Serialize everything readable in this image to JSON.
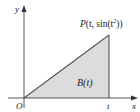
{
  "diagram": {
    "axes": {
      "x_label": "x",
      "y_label": "y",
      "origin_label": "O"
    },
    "point": {
      "label_prefix": "P",
      "label_args": "(t, sin(t",
      "label_sup": "2",
      "label_suffix": "))",
      "full_label": "P(t, sin(t²))"
    },
    "region": {
      "label": "B(t)",
      "shape": "triangle",
      "vertices": [
        "O",
        "P",
        "(t, 0)"
      ]
    },
    "tick": {
      "label": "t"
    },
    "colors": {
      "fill": "#d9d9d9",
      "stroke": "#555555",
      "text": "#222222",
      "background": "#ffffff"
    }
  }
}
